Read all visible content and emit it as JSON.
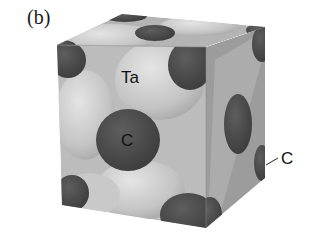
{
  "figure": {
    "panel_label": "(b)",
    "labels": {
      "ta": "Ta",
      "c_center": "C",
      "c_edge": "C"
    },
    "colors": {
      "ta_atom": "#c8c8c8",
      "c_atom": "#4a4a4a",
      "cube_face_front": "#bdbdbd",
      "cube_face_right": "#9a9a9a",
      "cube_face_top": "#b0b0b0"
    }
  }
}
